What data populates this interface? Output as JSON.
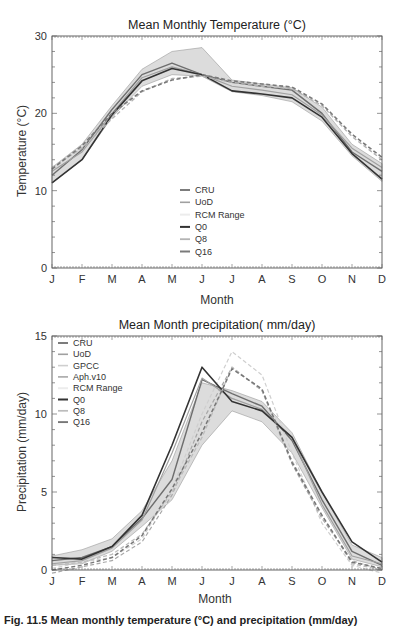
{
  "chart_data": [
    {
      "type": "line",
      "title": "Mean Monthly Temperature (°C)",
      "xlabel": "Month",
      "ylabel": "Temperature (°C)",
      "ylim": [
        0,
        30
      ],
      "yticks": [
        0,
        10,
        20,
        30
      ],
      "categories": [
        "J",
        "F",
        "M",
        "A",
        "M",
        "J",
        "J",
        "A",
        "S",
        "O",
        "N",
        "D"
      ],
      "grid": false,
      "legend_position": "center",
      "range": {
        "name": "RCM Range",
        "upper": [
          13,
          16,
          21,
          25.7,
          28,
          28.5,
          24.3,
          23.8,
          23.3,
          20.8,
          16,
          13.5
        ],
        "lower": [
          11,
          14,
          19.5,
          23.5,
          25,
          24.8,
          22.8,
          22.3,
          21.5,
          19,
          14.5,
          11.2
        ]
      },
      "series": [
        {
          "name": "CRU",
          "values": [
            12,
            15.3,
            20.5,
            25,
            26.5,
            25,
            24,
            23.5,
            23,
            20,
            15,
            12.5
          ],
          "color": "#6e6e6e",
          "dash": false,
          "width": 1.4
        },
        {
          "name": "UoD",
          "values": [
            12.5,
            15,
            20,
            24.6,
            26,
            25,
            23.5,
            23,
            22.4,
            19.8,
            15.5,
            13
          ],
          "color": "#a0a0a0",
          "dash": false,
          "width": 1.2
        },
        {
          "name": "Q0",
          "values": [
            11,
            14,
            19.8,
            24.2,
            25.8,
            25,
            22.9,
            22.5,
            22,
            19.5,
            14.8,
            11.5
          ],
          "color": "#333333",
          "dash": false,
          "width": 1.6
        },
        {
          "name": "Q8",
          "values": [
            13,
            15.5,
            19.3,
            22.8,
            24.5,
            24.8,
            24,
            23.5,
            23.2,
            21,
            17,
            14
          ],
          "color": "#b4b4b4",
          "dash": true,
          "width": 1.4
        },
        {
          "name": "Q16",
          "values": [
            12.8,
            15.8,
            20,
            22.9,
            24.3,
            25,
            24.2,
            23.8,
            23.4,
            21.2,
            17.3,
            14.3
          ],
          "color": "#7a7a7a",
          "dash": true,
          "width": 1.6
        }
      ],
      "legend": [
        "CRU",
        "UoD",
        "RCM Range",
        "Q0",
        "Q8",
        "Q16"
      ]
    },
    {
      "type": "line",
      "title": "Mean Month precipitation( mm/day)",
      "xlabel": "Month",
      "ylabel": "Precipitation (mm/day)",
      "ylim": [
        0,
        15
      ],
      "yticks": [
        0,
        5,
        10,
        15
      ],
      "categories": [
        "J",
        "F",
        "M",
        "A",
        "M",
        "J",
        "J",
        "A",
        "S",
        "O",
        "N",
        "D"
      ],
      "grid": false,
      "legend_position": "upper left",
      "range": {
        "name": "RCM Range",
        "upper": [
          0.9,
          1.3,
          2,
          3.8,
          7,
          12,
          11.5,
          10.8,
          8.8,
          5,
          1.6,
          0.8
        ],
        "lower": [
          0.3,
          0.4,
          1.2,
          2.8,
          4.5,
          8,
          10.2,
          9.5,
          7.5,
          4,
          0.7,
          0.2
        ]
      },
      "series": [
        {
          "name": "CRU",
          "values": [
            0.6,
            0.8,
            1.5,
            3.3,
            5.8,
            12.2,
            11.3,
            10.5,
            8.3,
            4.5,
            1.2,
            0.3
          ],
          "color": "#6e6e6e",
          "dash": false,
          "width": 1.4
        },
        {
          "name": "UoD",
          "values": [
            0.4,
            0.6,
            1.4,
            3.2,
            7.5,
            12.3,
            11,
            10.3,
            8.5,
            4.2,
            0.9,
            0.4
          ],
          "color": "#a0a0a0",
          "dash": false,
          "width": 1.2
        },
        {
          "name": "GPCC",
          "values": [
            0.1,
            0.5,
            0.8,
            2,
            5.2,
            10,
            14,
            12.5,
            7.5,
            3,
            0.3,
            -0.2
          ],
          "color": "#cfcfcf",
          "dash": true,
          "width": 1.2
        },
        {
          "name": "Aph.v10",
          "values": [
            -0.2,
            0.2,
            0.6,
            1.8,
            4.8,
            9.5,
            13,
            11.5,
            6.8,
            3.3,
            0.6,
            0
          ],
          "color": "#a8a8a8",
          "dash": true,
          "width": 1.2
        },
        {
          "name": "Q0",
          "values": [
            0.8,
            0.7,
            1.5,
            3.5,
            8,
            13,
            10.8,
            10.2,
            8.5,
            5,
            1.8,
            0.5
          ],
          "color": "#333333",
          "dash": false,
          "width": 1.6
        },
        {
          "name": "Q8",
          "values": [
            0.3,
            0.5,
            1,
            2.3,
            5,
            8.5,
            13,
            11.5,
            7,
            3.5,
            0.4,
            0
          ],
          "color": "#bcbcbc",
          "dash": true,
          "width": 1.3
        },
        {
          "name": "Q16",
          "values": [
            0,
            0.3,
            0.8,
            2.2,
            5.2,
            8.8,
            12.9,
            11.6,
            6.9,
            3.5,
            0.5,
            0.1
          ],
          "color": "#777777",
          "dash": true,
          "width": 1.5
        }
      ],
      "legend": [
        "CRU",
        "UoD",
        "GPCC",
        "Aph.v10",
        "RCM Range",
        "Q0",
        "Q8",
        "Q16"
      ]
    }
  ],
  "caption": "Fig. 11.5  Mean monthly temperature (°C) and precipitation (mm/day)"
}
